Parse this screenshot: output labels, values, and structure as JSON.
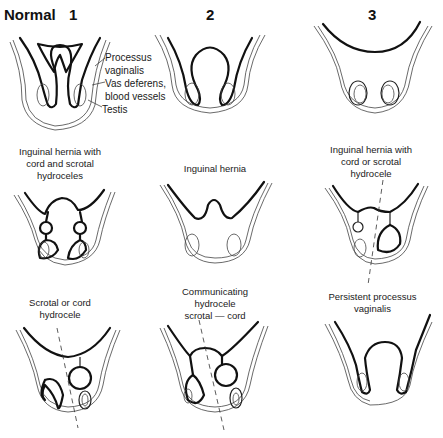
{
  "header": {
    "title": "Normal",
    "columns": [
      "1",
      "2",
      "3"
    ]
  },
  "annotations": {
    "processus": "Processus",
    "vaginalis": "vaginalis",
    "vas_deferens": "Vas deferens,",
    "blood_vessels": "blood vessels",
    "testis": "Testis"
  },
  "panels": {
    "row2": [
      {
        "caption": [
          "Inguinal hernia with",
          "cord and scrotal",
          "hydroceles"
        ]
      },
      {
        "caption": [
          "Inguinal hernia"
        ]
      },
      {
        "caption": [
          "Inguinal hernia with",
          "cord or scrotal",
          "hydrocele"
        ]
      }
    ],
    "row3": [
      {
        "caption": [
          "Scrotal or cord",
          "hydrocele"
        ]
      },
      {
        "caption": [
          "Communicating",
          "hydrocele",
          "scrotal — cord"
        ]
      },
      {
        "caption": [
          "Persistent processus",
          "vaginalis"
        ]
      }
    ]
  }
}
